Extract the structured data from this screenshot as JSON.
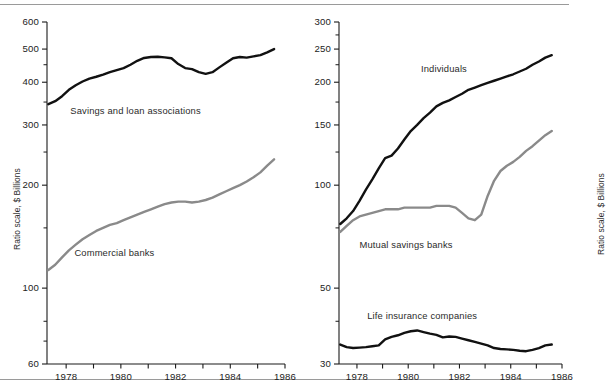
{
  "figure": {
    "width": 569,
    "height": 388,
    "background": "#ffffff",
    "rule_color": "#9a9a9a",
    "axis_color": "#1a1a1a"
  },
  "colors": {
    "black_series": "#111111",
    "gray_series": "#8a8a8a",
    "text": "#222222"
  },
  "chart_data": [
    {
      "type": "line",
      "panel": "left",
      "title": "",
      "xlabel": "",
      "ylabel": "Ratio scale, $ Billions",
      "scale": "log",
      "ylim": [
        60,
        600
      ],
      "xlim": [
        1977.3,
        1986.0
      ],
      "grid": false,
      "legend": "inline-annotations",
      "ytick_labels": [
        "600",
        "500",
        "400",
        "300",
        "200",
        "100",
        "60"
      ],
      "ytick_values": [
        600,
        500,
        400,
        300,
        200,
        100,
        60
      ],
      "yminor_values": [
        450,
        350,
        250,
        150,
        80,
        70
      ],
      "xtick_labels": [
        "1978",
        "1980",
        "1982",
        "1984",
        "1986"
      ],
      "xtick_values": [
        1978,
        1980,
        1982,
        1984,
        1986
      ],
      "xminor_values": [
        1979,
        1981,
        1983,
        1985
      ],
      "series": [
        {
          "name": "Savings and loan associations",
          "color": "#111111",
          "width": 2.4,
          "label_x": 1978.15,
          "label_y": 330,
          "x": [
            1977.35,
            1977.6,
            1977.85,
            1978.1,
            1978.35,
            1978.6,
            1978.85,
            1979.1,
            1979.35,
            1979.6,
            1979.85,
            1980.1,
            1980.35,
            1980.6,
            1980.85,
            1981.1,
            1981.35,
            1981.6,
            1981.85,
            1982.1,
            1982.35,
            1982.6,
            1982.85,
            1983.1,
            1983.35,
            1983.6,
            1983.85,
            1984.1,
            1984.35,
            1984.6,
            1984.85,
            1985.1,
            1985.35,
            1985.6
          ],
          "y": [
            345,
            352,
            364,
            380,
            392,
            402,
            410,
            415,
            421,
            428,
            434,
            440,
            450,
            462,
            471,
            474,
            475,
            473,
            470,
            452,
            440,
            437,
            428,
            423,
            428,
            442,
            456,
            470,
            474,
            472,
            476,
            480,
            489,
            500
          ]
        },
        {
          "name": "Commercial banks",
          "color": "#8a8a8a",
          "width": 2.4,
          "label_x": 1978.3,
          "label_y": 127,
          "x": [
            1977.35,
            1977.6,
            1977.85,
            1978.1,
            1978.35,
            1978.6,
            1978.85,
            1979.1,
            1979.35,
            1979.6,
            1979.85,
            1980.1,
            1980.35,
            1980.6,
            1980.85,
            1981.1,
            1981.35,
            1981.6,
            1981.85,
            1982.1,
            1982.35,
            1982.6,
            1982.85,
            1983.1,
            1983.35,
            1983.6,
            1983.85,
            1984.1,
            1984.35,
            1984.6,
            1984.85,
            1985.1,
            1985.35,
            1985.6
          ],
          "y": [
            113,
            117,
            123,
            129,
            134,
            139,
            143,
            147,
            150,
            153,
            155,
            158,
            161,
            164,
            167,
            170,
            173,
            176,
            178,
            179,
            179,
            178,
            179,
            181,
            184,
            188,
            192,
            196,
            200,
            205,
            211,
            218,
            228,
            238
          ]
        }
      ]
    },
    {
      "type": "line",
      "panel": "right",
      "title": "",
      "xlabel": "",
      "ylabel": "Ratio scale, $ Billions",
      "scale": "log",
      "ylim": [
        30,
        300
      ],
      "xlim": [
        1977.3,
        1986.0
      ],
      "grid": false,
      "legend": "inline-annotations",
      "ytick_labels": [
        "300",
        "250",
        "200",
        "150",
        "100",
        "50",
        "30"
      ],
      "ytick_values": [
        300,
        250,
        200,
        150,
        100,
        50,
        30
      ],
      "yminor_values": [
        275,
        225,
        175,
        125,
        75,
        40
      ],
      "xtick_labels": [
        "1978",
        "1980",
        "1982",
        "1984",
        "1986"
      ],
      "xtick_values": [
        1978,
        1980,
        1982,
        1984,
        1986
      ],
      "xminor_values": [
        1979,
        1981,
        1983,
        1985
      ],
      "series": [
        {
          "name": "Individuals",
          "color": "#111111",
          "width": 2.4,
          "label_x": 1980.5,
          "label_y": 218,
          "x": [
            1977.35,
            1977.6,
            1977.85,
            1978.1,
            1978.35,
            1978.6,
            1978.85,
            1979.1,
            1979.35,
            1979.6,
            1979.85,
            1980.1,
            1980.35,
            1980.6,
            1980.85,
            1981.1,
            1981.35,
            1981.6,
            1981.85,
            1982.1,
            1982.35,
            1982.6,
            1982.85,
            1983.1,
            1983.35,
            1983.6,
            1983.85,
            1984.1,
            1984.35,
            1984.6,
            1984.85,
            1985.1,
            1985.35,
            1985.6
          ],
          "y": [
            77,
            80,
            84,
            90,
            97,
            104,
            112,
            120,
            122,
            128,
            136,
            144,
            150,
            157,
            163,
            170,
            174,
            177,
            181,
            185,
            190,
            193,
            196,
            199,
            202,
            205,
            208,
            211,
            215,
            219,
            225,
            230,
            236,
            240
          ]
        },
        {
          "name": "Mutual savings banks",
          "color": "#8a8a8a",
          "width": 2.4,
          "label_x": 1978.1,
          "label_y": 67,
          "x": [
            1977.35,
            1977.6,
            1977.85,
            1978.1,
            1978.35,
            1978.6,
            1978.85,
            1979.1,
            1979.35,
            1979.6,
            1979.85,
            1980.1,
            1980.35,
            1980.6,
            1980.85,
            1981.1,
            1981.35,
            1981.6,
            1981.85,
            1982.1,
            1982.35,
            1982.6,
            1982.85,
            1983.1,
            1983.35,
            1983.6,
            1983.85,
            1984.1,
            1984.35,
            1984.6,
            1984.85,
            1985.1,
            1985.35,
            1985.6
          ],
          "y": [
            73,
            76,
            79,
            81,
            82,
            83,
            84,
            85,
            85,
            85,
            86,
            86,
            86,
            86,
            86,
            87,
            87,
            87,
            86,
            83,
            80,
            79,
            82,
            93,
            103,
            110,
            114,
            117,
            121,
            126,
            130,
            135,
            140,
            144
          ]
        },
        {
          "name": "Life insurance companies",
          "color": "#111111",
          "width": 2.4,
          "label_x": 1978.4,
          "label_y": 41.5,
          "x": [
            1977.35,
            1977.6,
            1977.85,
            1978.1,
            1978.35,
            1978.6,
            1978.85,
            1979.1,
            1979.35,
            1979.6,
            1979.85,
            1980.1,
            1980.35,
            1980.6,
            1980.85,
            1981.1,
            1981.35,
            1981.6,
            1981.85,
            1982.1,
            1982.35,
            1982.6,
            1982.85,
            1983.1,
            1983.35,
            1983.6,
            1983.85,
            1984.1,
            1984.35,
            1984.6,
            1984.85,
            1985.1,
            1985.35,
            1985.6
          ],
          "y": [
            34.2,
            33.6,
            33.4,
            33.5,
            33.6,
            33.8,
            34.0,
            35.4,
            36.0,
            36.4,
            37.0,
            37.4,
            37.6,
            37.2,
            36.8,
            36.5,
            35.9,
            36.1,
            36.0,
            35.6,
            35.2,
            34.8,
            34.4,
            34.0,
            33.4,
            33.2,
            33.1,
            33.0,
            32.8,
            32.7,
            33.0,
            33.4,
            34.0,
            34.2
          ]
        }
      ]
    }
  ]
}
